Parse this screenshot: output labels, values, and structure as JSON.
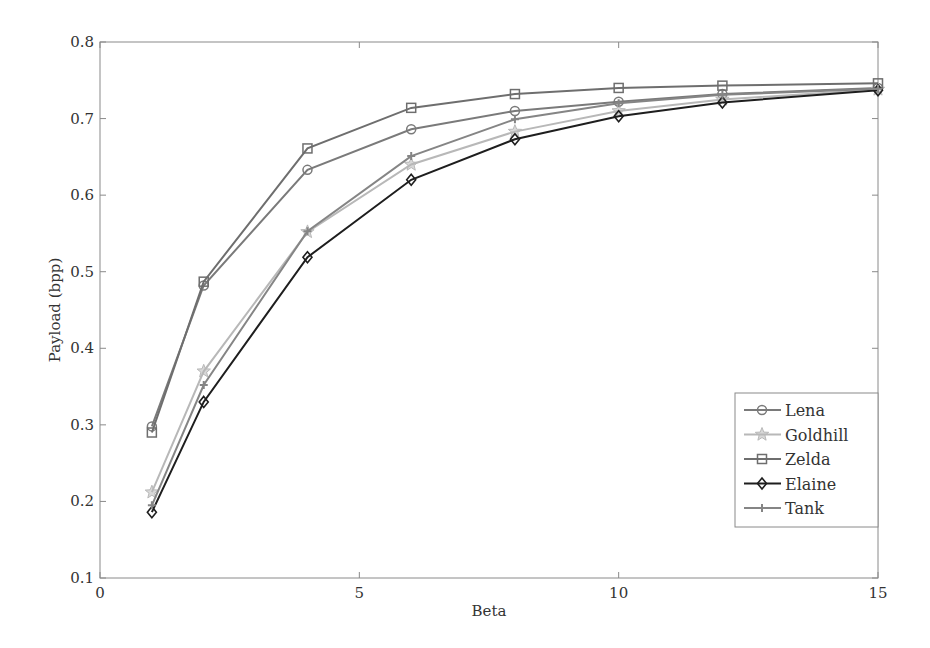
{
  "chart_data": {
    "type": "line",
    "title": "",
    "xlabel": "Beta",
    "ylabel": "Payload (bpp)",
    "xlim": [
      0,
      15
    ],
    "ylim": [
      0.1,
      0.8
    ],
    "xticks": [
      0,
      5,
      10,
      15
    ],
    "yticks": [
      0.1,
      0.2,
      0.3,
      0.4,
      0.5,
      0.6,
      0.7,
      0.8
    ],
    "xtick_labels": [
      "0",
      "5",
      "10",
      "15"
    ],
    "ytick_labels": [
      "0.1",
      "0.2",
      "0.3",
      "0.4",
      "0.5",
      "0.6",
      "0.7",
      "0.8"
    ],
    "grid": false,
    "legend_position": "lower right",
    "x": [
      1,
      2,
      4,
      6,
      8,
      10,
      12,
      15
    ],
    "series": [
      {
        "name": "Lena",
        "marker": "circle",
        "color": "#7a7a7a",
        "values": [
          0.298,
          0.482,
          0.633,
          0.686,
          0.71,
          0.722,
          0.732,
          0.74
        ]
      },
      {
        "name": "Goldhill",
        "marker": "star",
        "color": "#b8b8b8",
        "values": [
          0.212,
          0.37,
          0.552,
          0.64,
          0.683,
          0.71,
          0.725,
          0.738
        ]
      },
      {
        "name": "Zelda",
        "marker": "square",
        "color": "#6e6e6e",
        "values": [
          0.29,
          0.487,
          0.661,
          0.714,
          0.732,
          0.74,
          0.743,
          0.746
        ]
      },
      {
        "name": "Elaine",
        "marker": "diamond",
        "color": "#1e1e1e",
        "values": [
          0.186,
          0.33,
          0.519,
          0.62,
          0.673,
          0.703,
          0.721,
          0.737
        ]
      },
      {
        "name": "Tank",
        "marker": "plus",
        "color": "#858585",
        "values": [
          0.195,
          0.352,
          0.553,
          0.651,
          0.699,
          0.72,
          0.731,
          0.739
        ]
      }
    ]
  }
}
